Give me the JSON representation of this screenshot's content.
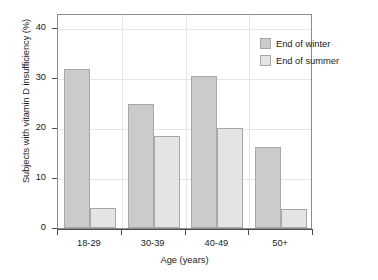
{
  "chart_data": {
    "type": "bar",
    "title": "",
    "xlabel": "Age (years)",
    "ylabel": "Subjects with vitamin D insufficiency (%)",
    "categories": [
      "18-29",
      "30-39",
      "40-49",
      "50+"
    ],
    "series": [
      {
        "name": "End of winter",
        "values": [
          31.9,
          24.8,
          30.4,
          16.2
        ],
        "color": "#cbcbcb"
      },
      {
        "name": "End of summer",
        "values": [
          4.1,
          18.5,
          20.0,
          3.8
        ],
        "color": "#e4e4e4"
      }
    ],
    "ylim": [
      0,
      43
    ],
    "yticks": [
      0,
      10,
      20,
      30,
      40
    ],
    "ytick_labels": [
      "0",
      "10",
      "20",
      "30",
      "40"
    ],
    "grid": true,
    "legend_position": "top-right"
  },
  "legend": {
    "items": [
      {
        "label": "End of winter"
      },
      {
        "label": "End of summer"
      }
    ]
  }
}
